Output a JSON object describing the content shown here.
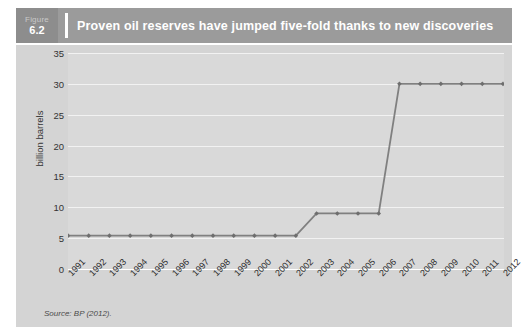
{
  "figure": {
    "label_word": "Figure",
    "number": "6.2",
    "title": "Proven oil reserves have jumped five-fold thanks to new discoveries",
    "source_note": "Source: BP (2012)."
  },
  "colors": {
    "header_bar": "#9b9b9b",
    "figure_block": "#8d8d8d",
    "header_text": "#ffffff",
    "chart_frame": "#d4d4d4",
    "plot_background": "#d9d9d9",
    "gridline": "#f2f2f2",
    "series_line": "#808080",
    "marker": "#6e6e6e"
  },
  "chart_data": {
    "type": "line",
    "title": "Proven oil reserves have jumped five-fold thanks to new discoveries",
    "xlabel": "",
    "ylabel": "billion barrels",
    "categories": [
      "1991",
      "1992",
      "1993",
      "1994",
      "1995",
      "1996",
      "1997",
      "1998",
      "1999",
      "2000",
      "2001",
      "2002",
      "2003",
      "2004",
      "2005",
      "2006",
      "2007",
      "2008",
      "2009",
      "2010",
      "2011",
      "2012"
    ],
    "values": [
      5.4,
      5.4,
      5.4,
      5.4,
      5.4,
      5.4,
      5.4,
      5.4,
      5.4,
      5.4,
      5.4,
      5.4,
      9.0,
      9.0,
      9.0,
      9.0,
      30.0,
      30.0,
      30.0,
      30.0,
      30.0,
      30.0
    ],
    "series": [
      {
        "name": "Proven oil reserves",
        "values": [
          5.4,
          5.4,
          5.4,
          5.4,
          5.4,
          5.4,
          5.4,
          5.4,
          5.4,
          5.4,
          5.4,
          5.4,
          9.0,
          9.0,
          9.0,
          9.0,
          30.0,
          30.0,
          30.0,
          30.0,
          30.0,
          30.0
        ]
      }
    ],
    "ylim": [
      0,
      35
    ],
    "yticks": [
      0,
      5,
      10,
      15,
      20,
      25,
      30,
      35
    ],
    "ytick_labels": [
      "0",
      "5",
      "10",
      "15",
      "20",
      "25",
      "30",
      "35"
    ],
    "grid": true,
    "legend": false,
    "marker": "diamond",
    "source": "Source: BP (2012)."
  }
}
